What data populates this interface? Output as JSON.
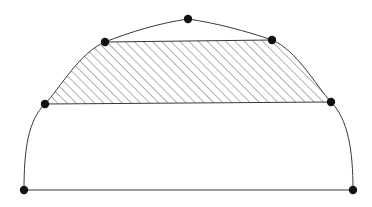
{
  "figure": {
    "canvas": {
      "width": 372,
      "height": 207,
      "background": "#ffffff"
    },
    "style": {
      "stroke_color": "#3a3a3a",
      "stroke_width": 1,
      "hatch_color": "#555555",
      "hatch_width": 0.9,
      "hatch_spacing": 6.5,
      "hatch_angle_deg": 45,
      "vertex_color": "#111111",
      "vertex_radius": 4.2
    },
    "vertices": [
      {
        "name": "bottom-left",
        "x": 24,
        "y": 190
      },
      {
        "name": "bottom-right",
        "x": 353,
        "y": 190
      },
      {
        "name": "left-mid",
        "x": 45,
        "y": 104
      },
      {
        "name": "right-mid",
        "x": 331,
        "y": 102
      },
      {
        "name": "upper-left",
        "x": 105,
        "y": 42
      },
      {
        "name": "upper-right",
        "x": 272,
        "y": 40
      },
      {
        "name": "apex",
        "x": 188,
        "y": 19
      }
    ],
    "edges": [
      {
        "name": "base-line",
        "type": "line",
        "from": "bottom-left",
        "to": "bottom-right"
      },
      {
        "name": "middle-chord",
        "type": "line",
        "from": "left-mid",
        "to": "right-mid"
      },
      {
        "name": "top-chord",
        "type": "line",
        "from": "upper-left",
        "to": "upper-right"
      },
      {
        "name": "lower-left-arc",
        "type": "arc",
        "from": "bottom-left",
        "to": "left-mid"
      },
      {
        "name": "lower-right-arc",
        "type": "arc",
        "from": "right-mid",
        "to": "bottom-right"
      },
      {
        "name": "upper-left-arc",
        "type": "arc",
        "from": "left-mid",
        "to": "upper-left"
      },
      {
        "name": "upper-right-arc",
        "type": "arc",
        "from": "upper-right",
        "to": "right-mid"
      },
      {
        "name": "crown-left-arc",
        "type": "arc",
        "from": "upper-left",
        "to": "apex"
      },
      {
        "name": "crown-right-arc",
        "type": "arc",
        "from": "apex",
        "to": "upper-right"
      }
    ],
    "regions": [
      {
        "name": "hatched-band",
        "filled": "hatched",
        "bounded_by": [
          "top-chord",
          "upper-right-arc",
          "middle-chord",
          "upper-left-arc"
        ]
      },
      {
        "name": "lower-region",
        "filled": "none",
        "bounded_by": [
          "middle-chord",
          "lower-right-arc",
          "base-line",
          "lower-left-arc"
        ]
      },
      {
        "name": "crown-region",
        "filled": "none",
        "bounded_by": [
          "crown-left-arc",
          "crown-right-arc",
          "top-chord"
        ]
      }
    ],
    "paths": {
      "outer_dome": "M 24 190 C 24 150 28 120 45 104 C 60 88 80 52 105 42 C 130 32 160 23 188 19 C 216 23 246 31 272 40 C 297 50 316 86 331 102 C 348 119 353 150 353 190",
      "hatched_region": "M 105 42 L 272 40 C 297 50 316 86 331 102 L 45 104 C 60 88 80 52 105 42 Z",
      "upper_left_arc": "M 45 104 C 60 88 80 52 105 42",
      "upper_right_arc": "M 272 40 C 297 50 316 86 331 102",
      "lower_left_arc": "M 24 190 C 24 150 28 120 45 104",
      "lower_right_arc": "M 331 102 C 348 119 353 150 353 190",
      "crown_arc": "M 105 42 C 130 32 160 23 188 19 C 216 23 246 31 272 40",
      "base_line": "M 24 190 L 353 190",
      "middle_chord": "M 45 104 L 331 102",
      "top_chord": "M 105 42 L 272 40"
    }
  }
}
